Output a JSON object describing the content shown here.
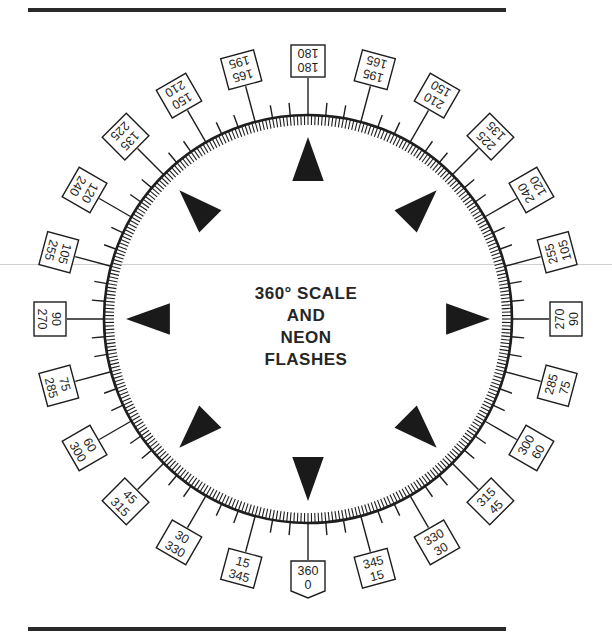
{
  "diagram": {
    "title_lines": [
      "360° SCALE",
      "AND",
      "NEON",
      "FLASHES"
    ],
    "center": {
      "x": 308,
      "y": 319
    },
    "circle_radius": 204,
    "fine_tick_step_deg": 1,
    "minor_tick_step_deg": 5,
    "label_step_deg": 15,
    "ink_color": "#1e1e1e",
    "background": "#ffffff",
    "labels": [
      {
        "angle": 0,
        "top": "360",
        "bottom": "0",
        "pointer": true
      },
      {
        "angle": 15,
        "top": "345",
        "bottom": "15"
      },
      {
        "angle": 30,
        "top": "330",
        "bottom": "30"
      },
      {
        "angle": 45,
        "top": "315",
        "bottom": "45"
      },
      {
        "angle": 60,
        "top": "300",
        "bottom": "60"
      },
      {
        "angle": 75,
        "top": "285",
        "bottom": "75"
      },
      {
        "angle": 90,
        "top": "270",
        "bottom": "90"
      },
      {
        "angle": 105,
        "top": "255",
        "bottom": "105"
      },
      {
        "angle": 120,
        "top": "240",
        "bottom": "120"
      },
      {
        "angle": 135,
        "top": "225",
        "bottom": "135"
      },
      {
        "angle": 150,
        "top": "210",
        "bottom": "150"
      },
      {
        "angle": 165,
        "top": "195",
        "bottom": "165"
      },
      {
        "angle": 180,
        "top": "180",
        "bottom": "180"
      },
      {
        "angle": 195,
        "top": "165",
        "bottom": "195"
      },
      {
        "angle": 210,
        "top": "150",
        "bottom": "210"
      },
      {
        "angle": 225,
        "top": "135",
        "bottom": "225"
      },
      {
        "angle": 240,
        "top": "120",
        "bottom": "240"
      },
      {
        "angle": 255,
        "top": "105",
        "bottom": "255"
      },
      {
        "angle": 270,
        "top": "90",
        "bottom": "270"
      },
      {
        "angle": 285,
        "top": "75",
        "bottom": "285"
      },
      {
        "angle": 300,
        "top": "60",
        "bottom": "300"
      },
      {
        "angle": 315,
        "top": "45",
        "bottom": "315"
      },
      {
        "angle": 330,
        "top": "30",
        "bottom": "330"
      },
      {
        "angle": 345,
        "top": "15",
        "bottom": "345"
      }
    ],
    "neon_flash_markers_deg": [
      0,
      45,
      90,
      135,
      180,
      225,
      270,
      315
    ]
  }
}
